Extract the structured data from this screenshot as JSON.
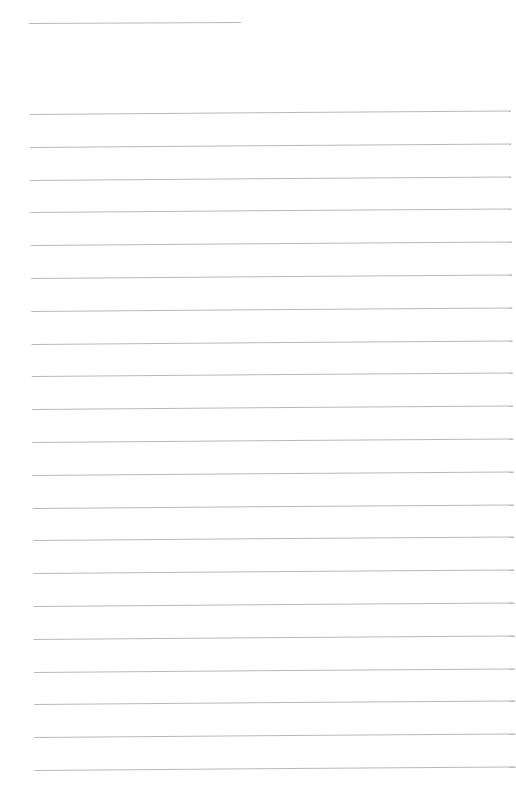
{
  "page": {
    "type": "lined-paper",
    "background_color": "#ffffff",
    "rule_color": "#b9b9b9",
    "header_rule": {
      "x": 29,
      "y": 23,
      "width": 212
    },
    "body_rules": {
      "count": 21,
      "first_y": 114,
      "spacing": 32.8,
      "x": 29,
      "width": 481
    },
    "text_content": ""
  }
}
